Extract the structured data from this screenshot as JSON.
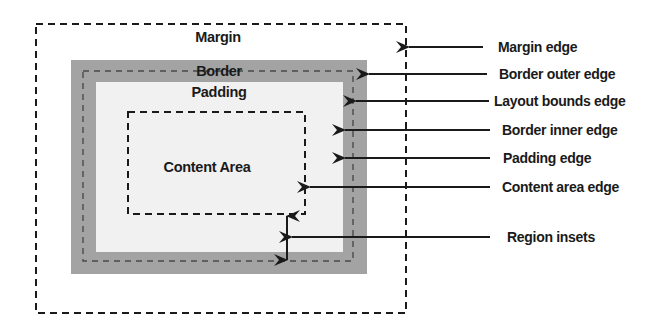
{
  "diagram": {
    "title": "",
    "colors": {
      "border_region": "#a3a3a3",
      "padding_region": "#f1f1f1",
      "background": "#ffffff",
      "line": "#1a1a1a",
      "layout_bounds_dash": "#555555"
    },
    "regions": {
      "margin": {
        "label": "Margin"
      },
      "border": {
        "label": "Border"
      },
      "padding": {
        "label": "Padding"
      },
      "content": {
        "label": "Content Area"
      }
    },
    "callouts": [
      {
        "id": "margin-edge",
        "label": "Margin edge"
      },
      {
        "id": "border-outer-edge",
        "label": "Border outer edge"
      },
      {
        "id": "layout-bounds-edge",
        "label": "Layout bounds edge"
      },
      {
        "id": "border-inner-edge",
        "label": "Border inner edge"
      },
      {
        "id": "padding-edge",
        "label": "Padding edge"
      },
      {
        "id": "content-area-edge",
        "label": "Content area edge"
      },
      {
        "id": "region-insets",
        "label": "Region insets"
      }
    ]
  }
}
